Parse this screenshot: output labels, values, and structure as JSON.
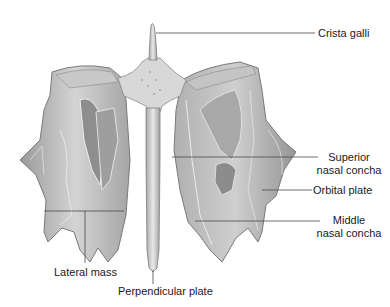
{
  "diagram": {
    "colors": {
      "background": "#ffffff",
      "bone_light": "#e6e6e6",
      "bone_mid": "#b8b8b8",
      "bone_dark": "#7a7a7a",
      "leader_line": "#4a4a4a",
      "text": "#1a1a1a"
    },
    "labels": {
      "crista_galli": "Crista galli",
      "superior_nasal_concha_line1": "Superior",
      "superior_nasal_concha_line2": "nasal concha",
      "orbital_plate": "Orbital plate",
      "middle_nasal_concha_line1": "Middle",
      "middle_nasal_concha_line2": "nasal concha",
      "lateral_mass": "Lateral mass",
      "perpendicular_plate": "Perpendicular plate"
    }
  }
}
